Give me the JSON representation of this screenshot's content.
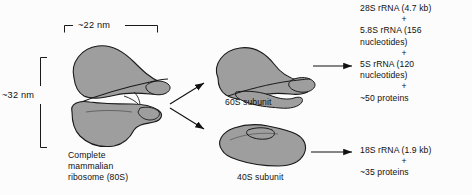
{
  "figure": {
    "type": "biology-schematic",
    "background_color": "#fcfcfc",
    "structure_fill": "#9e9e9e",
    "outline_color": "#1a1a1a"
  },
  "dimensions": {
    "width_label": "~22 nm",
    "height_label": "~32 nm"
  },
  "particles": {
    "complete": {
      "caption_line1": "Complete",
      "caption_line2": "mammalian",
      "caption_line3": "ribosome (80S)"
    },
    "large_subunit": {
      "caption": "60S subunit"
    },
    "small_subunit": {
      "caption": "40S subunit"
    }
  },
  "composition": {
    "large_subunit_components": [
      "28S rRNA (4.7 kb)",
      "+",
      "5.8S rRNA (156",
      "nucleotides)",
      "+",
      "5S rRNA (120",
      "nucleotides)",
      "+",
      "~50 proteins"
    ],
    "small_subunit_components": [
      "18S rRNA (1.9 kb)",
      "+",
      "~35 proteins"
    ]
  },
  "icons": {
    "dissociation_arrow_upper": "arrow-upper-right-icon",
    "dissociation_arrow_lower": "arrow-lower-right-icon",
    "composition_arrow_large": "arrow-right-icon",
    "composition_arrow_small": "arrow-right-icon",
    "bracket_horizontal": "dimension-bracket-horizontal-icon",
    "bracket_vertical": "dimension-bracket-vertical-icon"
  }
}
